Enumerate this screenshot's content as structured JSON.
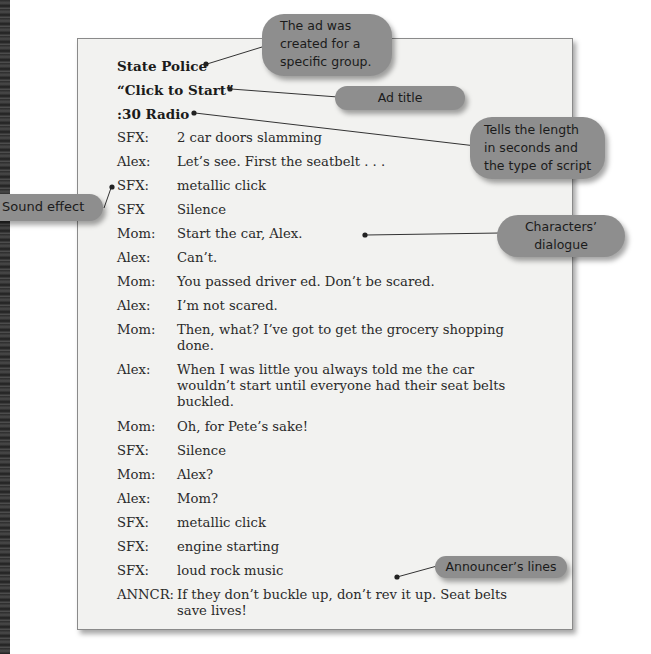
{
  "script": {
    "client": "State Police",
    "title": "“Click to Start”",
    "format": ":30 Radio",
    "lines": [
      {
        "speaker": "SFX:",
        "text": "2 car doors slamming"
      },
      {
        "speaker": "Alex:",
        "text": "Let’s see. First the seatbelt . . ."
      },
      {
        "speaker": "SFX:",
        "text": "metallic click"
      },
      {
        "speaker": "SFX",
        "text": "Silence"
      },
      {
        "speaker": "Mom:",
        "text": "Start the car, Alex."
      },
      {
        "speaker": "Alex:",
        "text": "Can’t."
      },
      {
        "speaker": "Mom:",
        "text": "You passed driver ed. Don’t be scared."
      },
      {
        "speaker": "Alex:",
        "text": "I’m not scared."
      },
      {
        "speaker": "Mom:",
        "text": "Then, what? I’ve got to get the grocery shopping done."
      },
      {
        "speaker": "Alex:",
        "text": "When I was little you always told me the car wouldn’t start until everyone had their seat belts buckled."
      },
      {
        "speaker": "Mom:",
        "text": "Oh, for Pete’s sake!"
      },
      {
        "speaker": "SFX:",
        "text": "Silence"
      },
      {
        "speaker": "Mom:",
        "text": "Alex?"
      },
      {
        "speaker": "Alex:",
        "text": "Mom?"
      },
      {
        "speaker": "SFX:",
        "text": "metallic click"
      },
      {
        "speaker": "SFX:",
        "text": "engine starting"
      },
      {
        "speaker": "SFX:",
        "text": "loud rock music"
      },
      {
        "speaker": "ANNCR:",
        "text": "If they don’t buckle up, don’t rev it up. Seat belts save lives!"
      }
    ]
  },
  "callouts": {
    "target_group": "The ad was created for a specific group.",
    "ad_title": "Ad title",
    "length_type": "Tells the length in seconds and the type of script",
    "sound_effect": "Sound effect",
    "dialogue": "Characters’ dialogue",
    "announcer": "Announcer’s lines"
  },
  "colors": {
    "callout_bg": "#8e8e8e",
    "page_bg": "#f2f2f0",
    "text": "#2a2a2a"
  }
}
